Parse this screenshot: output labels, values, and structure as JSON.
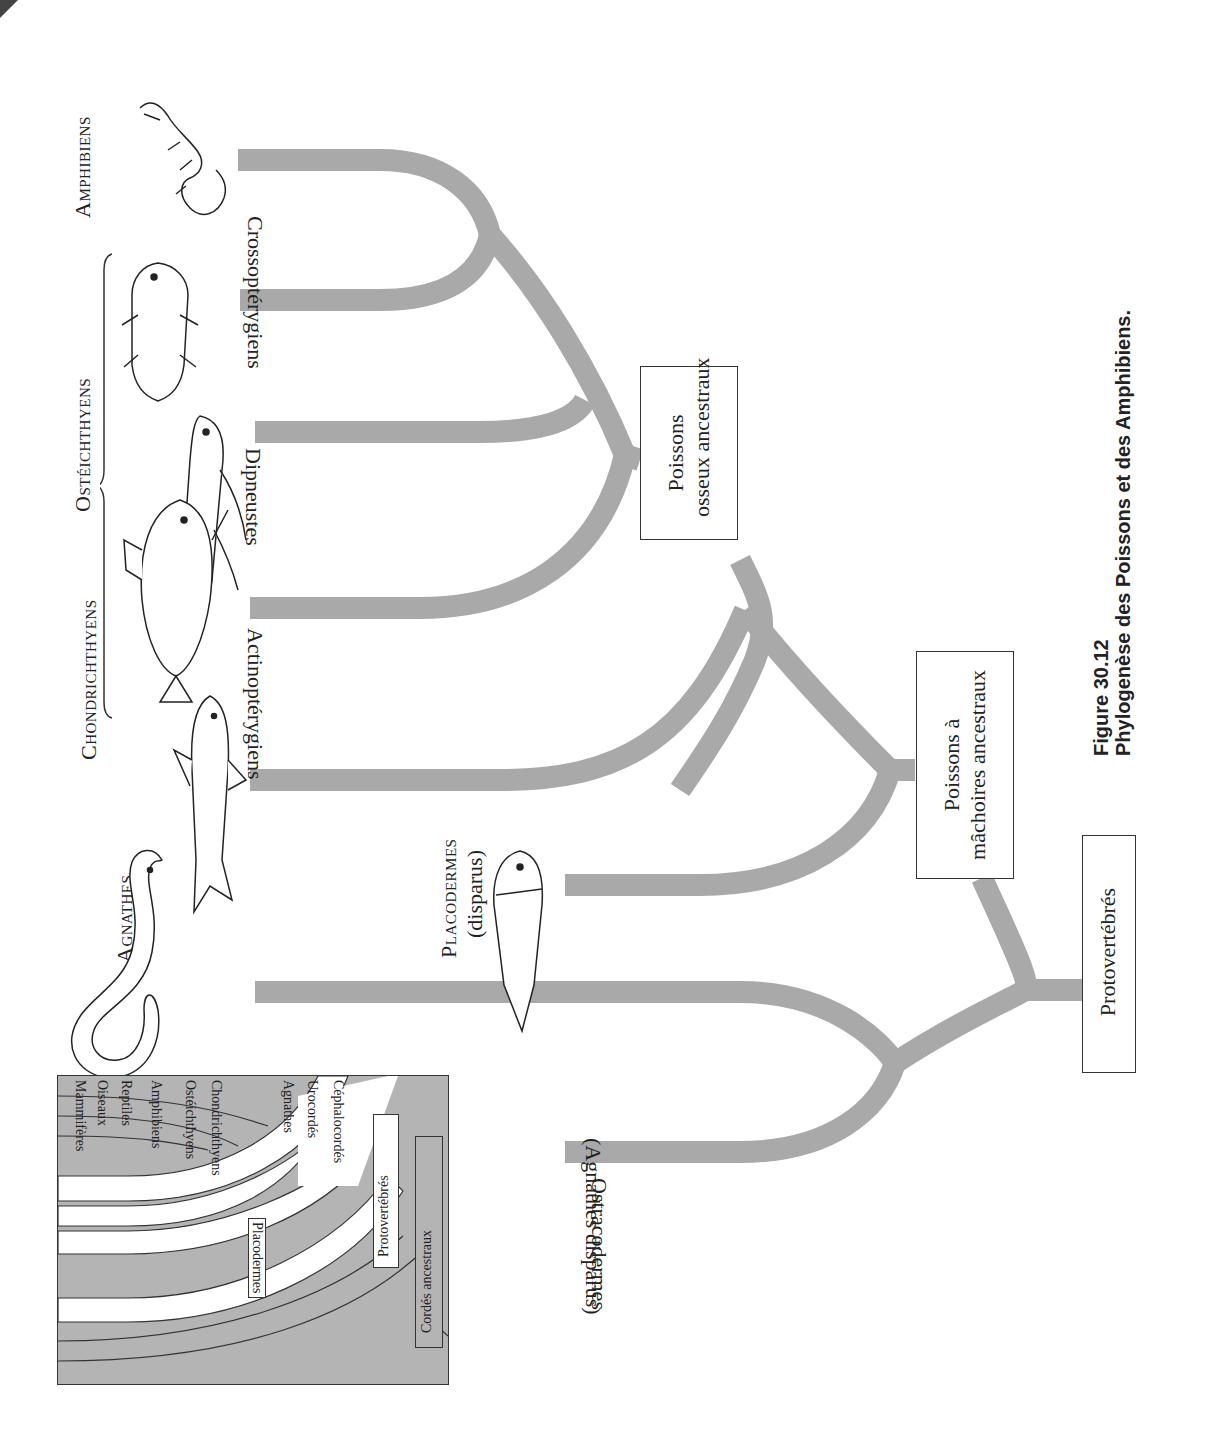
{
  "figure": {
    "number": "Figure 30.12",
    "title": "Phylogenèse des Poissons et des Amphibiens."
  },
  "colors": {
    "branch": "#a9a9a9",
    "inset_bg": "#b4b4b4",
    "box_border": "#333333",
    "text": "#222222"
  },
  "groups": {
    "amphibiens": "Amphibiens",
    "osteichthyens": "Ostéichthyens",
    "chondrichthyens": "Chondrichthyens",
    "agnathes": "Agnathes",
    "placodermes": "Placodermes",
    "placodermes_sub": "(disparus)"
  },
  "branches": {
    "crossopterygiens": "Crossoptérygiens",
    "dipneustes": "Dipneustes",
    "actinopterygiens": "Actinoptérygiens",
    "ostracodermes": "Ostracodermes",
    "ostracodermes_sub": "(Agnathes disparus)"
  },
  "nodes": {
    "poissons_osseux_l1": "Poissons",
    "poissons_osseux_l2": "osseux ancestraux",
    "poissons_machoires_l1": "Poissons à",
    "poissons_machoires_l2": "mâchoires ancestraux",
    "protovertebres": "Protovertébrés"
  },
  "illustrations": {
    "amphibian": "salamander-illustration",
    "crossopterygian": "coelacanth-illustration",
    "dipnoan": "lungfish-illustration",
    "actinopterygian": "perch-illustration",
    "chondrichthyan": "shark-illustration",
    "agnathan": "lamprey-illustration",
    "placoderm": "placoderm-illustration"
  },
  "inset": {
    "leaves": [
      "Mammifères",
      "Oiseaux",
      "Reptiles",
      "Amphibiens",
      "Ostéichthyens",
      "Chondrichthyens",
      "Placodermes",
      "Agnathes",
      "Urocordés",
      "Céphalocordés"
    ],
    "protovertebres": "Protovertébrés",
    "cordes": "Cordés ancestraux"
  }
}
